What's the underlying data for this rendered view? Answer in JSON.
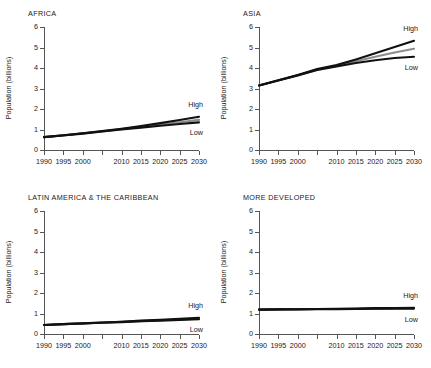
{
  "figure": {
    "background": "#ffffff",
    "axis_color": "#555555",
    "text_color": "#1a1a1a"
  },
  "axes": {
    "ylabel": "Population (billions)",
    "yticks": [
      "0",
      "1",
      "2",
      "3",
      "4",
      "5",
      "6"
    ],
    "xticks": [
      "1990",
      "1995",
      "2000",
      "",
      "2010",
      "2015",
      "2020",
      "2025",
      "2030"
    ]
  },
  "annotations": {
    "high": "High",
    "low": "Low"
  },
  "colors": {
    "high": "#111111",
    "medium": "#8d8d8d",
    "low": "#111111"
  },
  "panels": [
    {
      "key": "africa",
      "title": "AFRICA"
    },
    {
      "key": "asia",
      "title": "ASIA"
    },
    {
      "key": "latin_america",
      "title": "LATIN AMERICA & THE CARIBBEAN"
    },
    {
      "key": "more_developed",
      "title": "MORE DEVELOPED"
    }
  ],
  "chart_data": [
    {
      "type": "line",
      "title": "AFRICA",
      "xlabel": "",
      "ylabel": "Population (billions)",
      "xlim": [
        1990,
        2030
      ],
      "ylim": [
        0,
        6
      ],
      "grid": false,
      "legend": "inline-annotations",
      "x": [
        1990,
        1995,
        2000,
        2005,
        2010,
        2015,
        2020,
        2025,
        2030
      ],
      "series": [
        {
          "name": "High",
          "color": "#111111",
          "values": [
            0.63,
            0.72,
            0.82,
            0.93,
            1.04,
            1.17,
            1.31,
            1.46,
            1.62
          ]
        },
        {
          "name": "Medium",
          "color": "#8d8d8d",
          "values": [
            0.63,
            0.72,
            0.81,
            0.91,
            1.02,
            1.13,
            1.24,
            1.35,
            1.47
          ]
        },
        {
          "name": "Low",
          "color": "#111111",
          "values": [
            0.63,
            0.71,
            0.8,
            0.9,
            1.0,
            1.09,
            1.18,
            1.27,
            1.35
          ]
        }
      ]
    },
    {
      "type": "line",
      "title": "ASIA",
      "xlabel": "",
      "ylabel": "Population (billions)",
      "xlim": [
        1990,
        2030
      ],
      "ylim": [
        0,
        6
      ],
      "grid": false,
      "legend": "inline-annotations",
      "x": [
        1990,
        1995,
        2000,
        2005,
        2010,
        2015,
        2020,
        2025,
        2030
      ],
      "series": [
        {
          "name": "High",
          "color": "#111111",
          "values": [
            3.15,
            3.4,
            3.66,
            3.95,
            4.14,
            4.42,
            4.72,
            5.02,
            5.33
          ]
        },
        {
          "name": "Medium",
          "color": "#8d8d8d",
          "values": [
            3.15,
            3.4,
            3.65,
            3.92,
            4.1,
            4.33,
            4.55,
            4.76,
            4.94
          ]
        },
        {
          "name": "Low",
          "color": "#111111",
          "values": [
            3.15,
            3.39,
            3.64,
            3.9,
            4.07,
            4.24,
            4.38,
            4.49,
            4.55
          ]
        }
      ]
    },
    {
      "type": "line",
      "title": "LATIN AMERICA & THE CARIBBEAN",
      "xlabel": "",
      "ylabel": "Population (billions)",
      "xlim": [
        1990,
        2030
      ],
      "ylim": [
        0,
        6
      ],
      "grid": false,
      "legend": "inline-annotations",
      "x": [
        1990,
        1995,
        2000,
        2005,
        2010,
        2015,
        2020,
        2025,
        2030
      ],
      "series": [
        {
          "name": "High",
          "color": "#111111",
          "values": [
            0.44,
            0.48,
            0.52,
            0.56,
            0.6,
            0.65,
            0.69,
            0.74,
            0.79
          ]
        },
        {
          "name": "Medium",
          "color": "#8d8d8d",
          "values": [
            0.44,
            0.48,
            0.52,
            0.56,
            0.59,
            0.63,
            0.67,
            0.71,
            0.75
          ]
        },
        {
          "name": "Low",
          "color": "#111111",
          "values": [
            0.44,
            0.48,
            0.51,
            0.55,
            0.58,
            0.62,
            0.65,
            0.69,
            0.72
          ]
        }
      ]
    },
    {
      "type": "line",
      "title": "MORE DEVELOPED",
      "xlabel": "",
      "ylabel": "Population (billions)",
      "xlim": [
        1990,
        2030
      ],
      "ylim": [
        0,
        6
      ],
      "grid": false,
      "legend": "inline-annotations",
      "x": [
        1990,
        1995,
        2000,
        2005,
        2010,
        2015,
        2020,
        2025,
        2030
      ],
      "series": [
        {
          "name": "High",
          "color": "#111111",
          "values": [
            1.19,
            1.2,
            1.21,
            1.22,
            1.23,
            1.24,
            1.26,
            1.27,
            1.28
          ]
        },
        {
          "name": "Medium",
          "color": "#8d8d8d",
          "values": [
            1.19,
            1.2,
            1.21,
            1.22,
            1.22,
            1.23,
            1.24,
            1.25,
            1.26
          ]
        },
        {
          "name": "Low",
          "color": "#111111",
          "values": [
            1.19,
            1.2,
            1.2,
            1.21,
            1.21,
            1.22,
            1.23,
            1.23,
            1.24
          ]
        }
      ]
    }
  ]
}
